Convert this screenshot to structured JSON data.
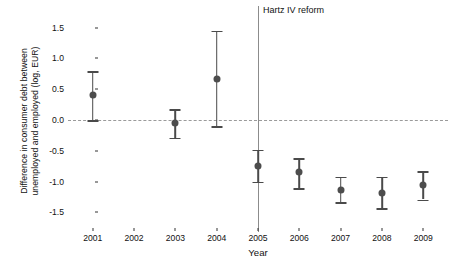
{
  "chart_data": {
    "type": "scatter",
    "title": "",
    "xlabel": "Year",
    "ylabel": "Difference in consumer debt between unemployed and employed (log, EUR)",
    "ylabel_line1": "Difference in consumer debt between",
    "ylabel_line2": "unemployed and employed (log, EUR)",
    "categories": [
      "2001",
      "2002",
      "2003",
      "2004",
      "2005",
      "2006",
      "2007",
      "2008",
      "2009"
    ],
    "x": [
      2001,
      2002,
      2003,
      2004,
      2005,
      2006,
      2007,
      2008,
      2009
    ],
    "values": [
      0.41,
      null,
      -0.05,
      0.67,
      -0.74,
      -0.85,
      -1.13,
      -1.18,
      -1.06
    ],
    "ci_lower": [
      0.0,
      null,
      -0.29,
      -0.1,
      -1.0,
      -1.11,
      -1.33,
      -1.43,
      -1.29
    ],
    "ci_upper": [
      0.79,
      null,
      0.18,
      1.45,
      -0.48,
      -0.62,
      -0.92,
      -0.92,
      -0.83
    ],
    "ytick_labels": [
      "1.5",
      "1.0",
      "0.5",
      "0.0",
      "-0.5",
      "-1.0",
      "-1.5"
    ],
    "ytick_values": [
      1.5,
      1.0,
      0.5,
      0.0,
      -0.5,
      -1.0,
      -1.5
    ],
    "ylim": [
      -1.72,
      1.72
    ],
    "xlim": [
      2000.4,
      2009.6
    ],
    "grid": false,
    "legend": null,
    "reference_line": {
      "value": 0.0,
      "style": "dashed"
    },
    "annotations": [
      {
        "text": "Hartz IV reform",
        "x": 2005,
        "type": "vertical-line-label"
      }
    ],
    "point_color": "#4d4d4d",
    "errorbar_color": "#4a4a4a",
    "reference_line_color": "#9a9a9a",
    "vline_color": "#8c8c8c",
    "background_color": "#ffffff"
  }
}
